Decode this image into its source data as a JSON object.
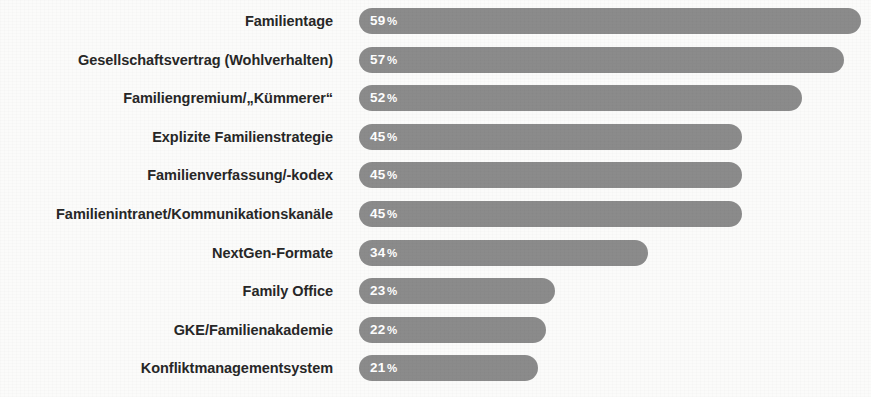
{
  "chart_data": {
    "type": "bar",
    "orientation": "horizontal",
    "title": "",
    "subtitle": "",
    "xlabel": "",
    "ylabel": "",
    "xlim": [
      0,
      100
    ],
    "grid": false,
    "legend": null,
    "value_suffix": "%",
    "value_label_position": "inside-left",
    "bar_color": "#8b8b8b",
    "label_color": "#272727",
    "value_text_color": "#ffffff",
    "background_color": "#fbfbfa",
    "categories": [
      "Familientage",
      "Gesellschaftsvertrag (Wohlverhalten)",
      "Familiengremium/„Kümmerer“",
      "Explizite Familienstrategie",
      "Familienverfassung/-kodex",
      "Familienintranet/Kommunikationskanäle",
      "NextGen-Formate",
      "Family Office",
      "GKE/Familienakademie",
      "Konfliktmanagementsystem"
    ],
    "values": [
      59,
      57,
      52,
      45,
      45,
      45,
      34,
      23,
      22,
      21
    ],
    "value_labels": [
      "59%",
      "57%",
      "52%",
      "45%",
      "45%",
      "45%",
      "34%",
      "23%",
      "22%",
      "21%"
    ],
    "bars": [
      {
        "label": "Familientage",
        "value": 59,
        "value_text": "59",
        "suffix": "%"
      },
      {
        "label": "Gesellschaftsvertrag (Wohlverhalten)",
        "value": 57,
        "value_text": "57",
        "suffix": "%"
      },
      {
        "label": "Familiengremium/„Kümmerer“",
        "value": 52,
        "value_text": "52",
        "suffix": "%"
      },
      {
        "label": "Explizite Familienstrategie",
        "value": 45,
        "value_text": "45",
        "suffix": "%"
      },
      {
        "label": "Familienverfassung/-kodex",
        "value": 45,
        "value_text": "45",
        "suffix": "%"
      },
      {
        "label": "Familienintranet/Kommunikationskanäle",
        "value": 45,
        "value_text": "45",
        "suffix": "%"
      },
      {
        "label": "NextGen-Formate",
        "value": 34,
        "value_text": "34",
        "suffix": "%"
      },
      {
        "label": "Family Office",
        "value": 23,
        "value_text": "23",
        "suffix": "%"
      },
      {
        "label": "GKE/Familienakademie",
        "value": 22,
        "value_text": "22",
        "suffix": "%"
      },
      {
        "label": "Konfliktmanagementsystem",
        "value": 21,
        "value_text": "21",
        "suffix": "%"
      }
    ]
  }
}
